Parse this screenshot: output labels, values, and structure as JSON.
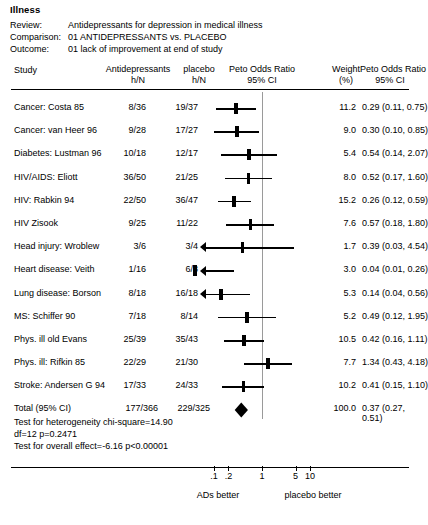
{
  "title": "Illness",
  "meta": {
    "review_label": "Review:",
    "review_value": "Antidepressants for depression in medical illness",
    "comparison_label": "Comparison:",
    "comparison_value": "01 ANTIDEPRESSANTS vs. PLACEBO",
    "outcome_label": "Outcome:",
    "outcome_value": "01 lack of improvement at end of study"
  },
  "headers": {
    "study": "Study",
    "treatment_l1": "Antidepressants",
    "treatment_l2": "h/N",
    "control_l1": "placebo",
    "control_l2": "h/N",
    "plot_l1": "Peto Odds Ratio",
    "plot_l2": "95% CI",
    "weight_l1": "Weight",
    "weight_l2": "(%)",
    "or_l1": "Peto Odds Ratio",
    "or_l2": "95% CI"
  },
  "axis": {
    "ticks": [
      {
        "label": ".1",
        "value": 0.1
      },
      {
        "label": ".2",
        "value": 0.2
      },
      {
        "label": "1",
        "value": 1
      },
      {
        "label": "5",
        "value": 5
      },
      {
        "label": "10",
        "value": 10
      }
    ],
    "left_caption": "ADs better",
    "right_caption": "placebo better",
    "scale": "log",
    "xmin": 0.05,
    "xmax": 20
  },
  "stats": {
    "heterogeneity": "Test for heterogeneity chi-square=14.90",
    "df_p": "df=12 p=0.2471",
    "overall": "Test for overall effect=-6.16 p<0.00001"
  },
  "total": {
    "label": "Total (95% CI)",
    "treatment": "177/366",
    "control": "229/325",
    "weight": "100.0",
    "or_text": "0.37 (0.27, 0.51)",
    "or": 0.37,
    "lower": 0.27,
    "upper": 0.51
  },
  "chart_data": {
    "type": "forest",
    "title": "Illness",
    "xlabel": "Peto Odds Ratio 95% CI",
    "ylabel": "Study",
    "scale": "log",
    "xlim": [
      0.05,
      20
    ],
    "null_value": 1,
    "grid": false,
    "legend": "none",
    "columns": [
      "Study",
      "Antidepressants h/N",
      "placebo h/N",
      "Peto Odds Ratio 95% CI",
      "Weight (%)",
      "Peto Odds Ratio 95% CI"
    ],
    "rows": [
      {
        "study": "Cancer: Costa 85",
        "treatment": "8/36",
        "control": "19/37",
        "weight": 11.2,
        "or": 0.29,
        "lower": 0.11,
        "upper": 0.75,
        "or_text": "0.29 (0.11, 0.75)"
      },
      {
        "study": "Cancer: van Heer 96",
        "treatment": "9/28",
        "control": "17/27",
        "weight": 9.0,
        "or": 0.3,
        "lower": 0.1,
        "upper": 0.85,
        "or_text": "0.30 (0.10, 0.85)"
      },
      {
        "study": "Diabetes: Lustman 96",
        "treatment": "10/18",
        "control": "12/17",
        "weight": 5.4,
        "or": 0.54,
        "lower": 0.14,
        "upper": 2.07,
        "or_text": "0.54 (0.14, 2.07)"
      },
      {
        "study": "HIV/AIDS: Eliott",
        "treatment": "36/50",
        "control": "21/25",
        "weight": 8.0,
        "or": 0.52,
        "lower": 0.17,
        "upper": 1.6,
        "or_text": "0.52 (0.17, 1.60)"
      },
      {
        "study": "HIV: Rabkin 94",
        "treatment": "22/50",
        "control": "36/47",
        "weight": 15.2,
        "or": 0.26,
        "lower": 0.12,
        "upper": 0.59,
        "or_text": "0.26 (0.12, 0.59)"
      },
      {
        "study": "HIV Zisook",
        "treatment": "9/25",
        "control": "11/22",
        "weight": 7.6,
        "or": 0.57,
        "lower": 0.18,
        "upper": 1.8,
        "or_text": "0.57 (0.18, 1.80)"
      },
      {
        "study": "Head injury: Wroblew",
        "treatment": "3/6",
        "control": "3/4",
        "weight": 1.7,
        "or": 0.39,
        "lower": 0.03,
        "upper": 4.54,
        "or_text": "0.39 (0.03, 4.54)"
      },
      {
        "study": "Heart disease: Veith",
        "treatment": "1/16",
        "control": "6/8",
        "weight": 3.0,
        "or": 0.04,
        "lower": 0.01,
        "upper": 0.26,
        "or_text": "0.04 (0.01, 0.26)"
      },
      {
        "study": "Lung disease: Borson",
        "treatment": "8/18",
        "control": "16/18",
        "weight": 5.3,
        "or": 0.14,
        "lower": 0.04,
        "upper": 0.56,
        "or_text": "0.14 (0.04, 0.56)"
      },
      {
        "study": "MS: Schiffer 90",
        "treatment": "7/18",
        "control": "8/14",
        "weight": 5.2,
        "or": 0.49,
        "lower": 0.12,
        "upper": 1.95,
        "or_text": "0.49 (0.12, 1.95)"
      },
      {
        "study": "Phys. ill old Evans",
        "treatment": "25/39",
        "control": "35/43",
        "weight": 10.5,
        "or": 0.42,
        "lower": 0.16,
        "upper": 1.11,
        "or_text": "0.42 (0.16, 1.11)"
      },
      {
        "study": "Phys. ill: Rifkin 85",
        "treatment": "22/29",
        "control": "21/30",
        "weight": 7.7,
        "or": 1.34,
        "lower": 0.43,
        "upper": 4.18,
        "or_text": "1.34 (0.43, 4.18)"
      },
      {
        "study": "Stroke: Andersen G 94",
        "treatment": "17/33",
        "control": "24/33",
        "weight": 10.2,
        "or": 0.41,
        "lower": 0.15,
        "upper": 1.1,
        "or_text": "0.41 (0.15, 1.10)"
      }
    ],
    "total": {
      "study": "Total (95% CI)",
      "treatment": "177/366",
      "control": "229/325",
      "weight": 100.0,
      "or": 0.37,
      "lower": 0.27,
      "upper": 0.51,
      "or_text": "0.37 (0.27, 0.51)"
    }
  }
}
